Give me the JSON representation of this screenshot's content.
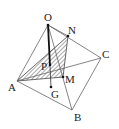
{
  "diagram": {
    "type": "geometry",
    "labels": {
      "O": "O",
      "N": "N",
      "C": "C",
      "A": "A",
      "P": "P",
      "M": "M",
      "G": "G",
      "B": "B"
    },
    "colors": {
      "line": "#555555",
      "bold_line": "#111111",
      "hatch": "#444444"
    }
  }
}
